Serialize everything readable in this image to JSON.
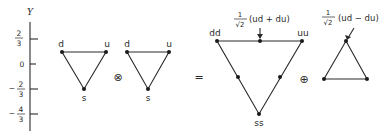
{
  "axis": {
    "title": "Y",
    "ticks": [
      {
        "num": "2",
        "den": "3",
        "sign": ""
      },
      {
        "label": "0"
      },
      {
        "num": "2",
        "den": "3",
        "sign": "−"
      },
      {
        "num": "4",
        "den": "3",
        "sign": "−"
      }
    ]
  },
  "triplet_a": {
    "labels": {
      "d": "d",
      "u": "u",
      "s": "s"
    }
  },
  "operator_tensor": "⊗",
  "triplet_b": {
    "labels": {
      "d": "d",
      "u": "u",
      "s": "s"
    }
  },
  "operator_equals": "=",
  "sextet": {
    "labels": {
      "dd": "dd",
      "uu": "uu",
      "ss": "ss"
    },
    "annotation": {
      "num": "1",
      "den": "√2",
      "text": "(ud + du)"
    }
  },
  "operator_direct_sum": "⊕",
  "antitriplet": {
    "annotation": {
      "num": "1",
      "den": "√2",
      "text": "(ud − du)"
    }
  }
}
